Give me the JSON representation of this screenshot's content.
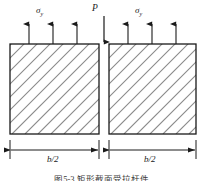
{
  "figure": {
    "type": "engineering-stress-diagram",
    "caption": "图5-3 矩形截面受拉杆件",
    "labels": {
      "sigma_left": "σ",
      "sigma_left_sub": "y",
      "sigma_right": "σ",
      "sigma_right_sub": "y",
      "load": "P",
      "dim_left": "b/2",
      "dim_right": "b/2"
    },
    "colors": {
      "stroke": "#1a1a1a",
      "hatch": "#8a8a8a",
      "background": "#ffffff",
      "caption_text": "#3b3b3b"
    },
    "geometry": {
      "block_top_y": 44,
      "block_bottom_y": 134,
      "left_block_x1": 10,
      "left_block_x2": 99,
      "right_block_x1": 109,
      "right_block_x2": 196,
      "dimension_line_y": 150,
      "gap_center_x": 104
    },
    "arrows": {
      "tension_up": [
        {
          "x": 29
        },
        {
          "x": 53
        },
        {
          "x": 77
        },
        {
          "x": 128
        },
        {
          "x": 152
        },
        {
          "x": 176
        }
      ],
      "tension_top_y": 22,
      "load_down": {
        "x": 104,
        "y_start": 16,
        "y_end": 44
      }
    },
    "hatching": {
      "direction": "lower-left-to-upper-right",
      "angle_deg": 45,
      "spacing_px": 13
    }
  }
}
